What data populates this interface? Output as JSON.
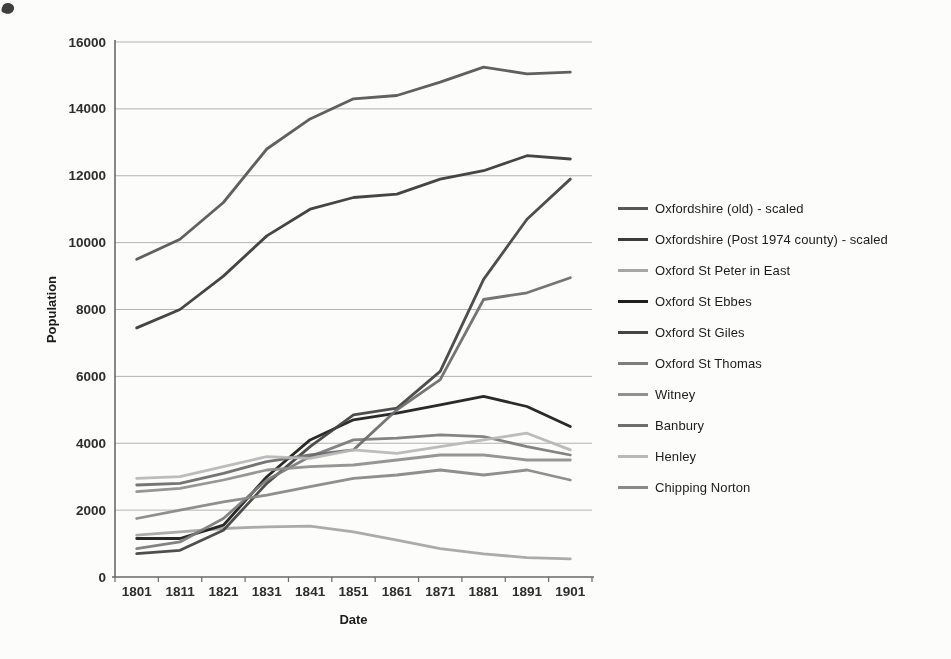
{
  "page": {
    "background": "#fcfcfb",
    "artifact": "dark-scan-mark-top-left"
  },
  "chart_data": {
    "type": "line",
    "title": "",
    "xlabel": "Date",
    "ylabel": "Population",
    "x": [
      1801,
      1811,
      1821,
      1831,
      1841,
      1851,
      1861,
      1871,
      1881,
      1891,
      1901
    ],
    "ylim": [
      0,
      16000
    ],
    "yticks": [
      0,
      2000,
      4000,
      6000,
      8000,
      10000,
      12000,
      14000,
      16000
    ],
    "grid": "horizontal",
    "legend_position": "right",
    "grid_color": "#b3b3b3",
    "axis_color": "#6a6a6a",
    "series": [
      {
        "name": "Oxfordshire (old) - scaled",
        "color": "#575757",
        "values": [
          9500,
          10100,
          11200,
          12800,
          13700,
          14300,
          14400,
          14800,
          15250,
          15050,
          15100
        ]
      },
      {
        "name": "Oxfordshire (Post 1974 county) - scaled",
        "color": "#3b3b3b",
        "values": [
          7450,
          8000,
          9000,
          10200,
          11000,
          11350,
          11450,
          11900,
          12150,
          12600,
          12500
        ]
      },
      {
        "name": "Oxford St Peter in East",
        "color": "#a6a6a6",
        "values": [
          1250,
          1350,
          1450,
          1500,
          1520,
          1350,
          1100,
          850,
          690,
          580,
          540
        ]
      },
      {
        "name": "Oxford St Ebbes",
        "color": "#1f1f1f",
        "values": [
          1150,
          1150,
          1550,
          3000,
          4100,
          4700,
          4900,
          5150,
          5400,
          5100,
          4500
        ]
      },
      {
        "name": "Oxford St Giles",
        "color": "#454545",
        "values": [
          700,
          800,
          1400,
          2800,
          3900,
          4850,
          5050,
          6150,
          8900,
          10700,
          11900
        ]
      },
      {
        "name": "Oxford St Thomas",
        "color": "#7d7d7d",
        "values": [
          850,
          1050,
          1750,
          2900,
          3600,
          4100,
          4150,
          4250,
          4200,
          3900,
          3650
        ]
      },
      {
        "name": "Witney",
        "color": "#909090",
        "values": [
          2550,
          2650,
          2900,
          3200,
          3300,
          3350,
          3500,
          3650,
          3650,
          3500,
          3500
        ]
      },
      {
        "name": "Banbury",
        "color": "#6e6e6e",
        "values": [
          2750,
          2800,
          3100,
          3450,
          3650,
          3800,
          5000,
          5900,
          8300,
          8500,
          8950
        ]
      },
      {
        "name": "Henley",
        "color": "#b8b8b8",
        "values": [
          2950,
          3000,
          3300,
          3600,
          3550,
          3800,
          3700,
          3900,
          4100,
          4300,
          3800
        ]
      },
      {
        "name": "Chipping Norton",
        "color": "#898989",
        "values": [
          1750,
          2000,
          2250,
          2450,
          2700,
          2950,
          3050,
          3200,
          3050,
          3200,
          2900
        ]
      }
    ]
  }
}
